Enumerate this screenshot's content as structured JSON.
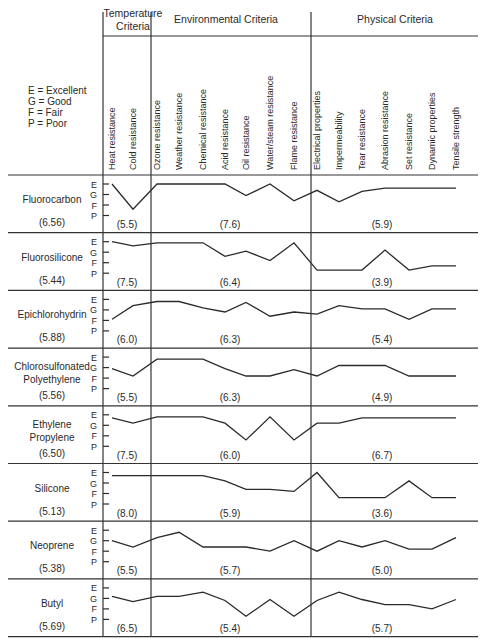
{
  "chart_data": {
    "type": "line",
    "rating_scale": [
      "P",
      "F",
      "G",
      "E"
    ],
    "rating_numeric": {
      "E": 4,
      "G": 3,
      "F": 2,
      "P": 1
    },
    "legend": [
      "E = Excellent",
      "G = Good",
      "F = Fair",
      "P = Poor"
    ],
    "groups": [
      {
        "name": "Temperature Criteria",
        "label_lines": [
          "Temperature",
          "Criteria"
        ],
        "columns": [
          "Heat resistance",
          "Cold resistance"
        ]
      },
      {
        "name": "Environmental Criteria",
        "label_lines": [
          "Environmental Criteria"
        ],
        "columns": [
          "Ozone resistance",
          "Weather resistance",
          "Chemical resistance",
          "Acid resistance",
          "Oil resistance",
          "Water/steam resistance",
          "Flame resistance"
        ]
      },
      {
        "name": "Physical Criteria",
        "label_lines": [
          "Physical Criteria"
        ],
        "columns": [
          "Electrical properties",
          "Impermeability",
          "Tear resistance",
          "Abrasion resistance",
          "Set resistance",
          "Dynamic properties",
          "Tensile strength"
        ]
      }
    ],
    "categories": [
      "Heat resistance",
      "Cold resistance",
      "Ozone resistance",
      "Weather resistance",
      "Chemical resistance",
      "Acid resistance",
      "Oil resistance",
      "Water/steam resistance",
      "Flame resistance",
      "Electrical properties",
      "Impermeability",
      "Tear resistance",
      "Abrasion resistance",
      "Set resistance",
      "Dynamic properties",
      "Tensile strength"
    ],
    "series": [
      {
        "name": "Fluorocarbon",
        "label_lines": [
          "Fluorocarbon"
        ],
        "overall": "(6.56)",
        "group_scores": [
          "(5.5)",
          "(7.6)",
          "(5.9)"
        ],
        "values": [
          4.0,
          1.6,
          4.0,
          4.0,
          4.0,
          4.0,
          2.9,
          4.0,
          2.4,
          3.4,
          2.3,
          3.3,
          3.6,
          3.6,
          3.6,
          3.6
        ]
      },
      {
        "name": "Fluorosilicone",
        "label_lines": [
          "Fluorosilicone"
        ],
        "overall": "(5.44)",
        "group_scores": [
          "(7.5)",
          "(6.4)",
          "(3.9)"
        ],
        "values": [
          4.0,
          3.6,
          3.9,
          3.9,
          3.9,
          2.6,
          3.1,
          2.2,
          3.9,
          1.3,
          1.3,
          1.3,
          3.2,
          1.3,
          1.7,
          1.7
        ]
      },
      {
        "name": "Epichlorohydrin",
        "label_lines": [
          "Epichlorohydrin"
        ],
        "overall": "(5.88)",
        "group_scores": [
          "(6.0)",
          "(6.3)",
          "(5.4)"
        ],
        "values": [
          2.1,
          3.4,
          3.8,
          3.8,
          3.2,
          2.8,
          3.7,
          2.4,
          2.8,
          2.6,
          3.4,
          3.1,
          3.1,
          2.1,
          3.1,
          3.1
        ]
      },
      {
        "name": "Chlorosulfonated Polyethylene",
        "label_lines": [
          "Chlorosulfonated",
          "Polyethylene"
        ],
        "overall": "(5.56)",
        "group_scores": [
          "(5.5)",
          "(6.3)",
          "(4.9)"
        ],
        "values": [
          2.9,
          2.2,
          3.8,
          3.8,
          3.8,
          2.9,
          2.2,
          2.2,
          2.8,
          2.2,
          3.2,
          3.2,
          3.2,
          2.2,
          2.2,
          2.2
        ]
      },
      {
        "name": "Ethylene Propylene",
        "label_lines": [
          "Ethylene",
          "Propylene"
        ],
        "overall": "(6.50)",
        "group_scores": [
          "(7.5)",
          "(6.0)",
          "(6.7)"
        ],
        "values": [
          3.7,
          3.2,
          3.8,
          3.8,
          3.8,
          3.2,
          1.6,
          3.8,
          1.6,
          3.2,
          3.2,
          3.7,
          3.7,
          3.7,
          3.7,
          3.7
        ]
      },
      {
        "name": "Silicone",
        "label_lines": [
          "Silicone"
        ],
        "overall": "(5.13)",
        "group_scores": [
          "(8.0)",
          "(5.9)",
          "(3.6)"
        ],
        "values": [
          3.7,
          3.7,
          3.7,
          3.7,
          3.7,
          3.2,
          2.4,
          2.4,
          2.2,
          4.0,
          1.6,
          1.6,
          1.6,
          3.2,
          1.6,
          1.6
        ]
      },
      {
        "name": "Neoprene",
        "label_lines": [
          "Neoprene"
        ],
        "overall": "(5.38)",
        "group_scores": [
          "(5.5)",
          "(5.7)",
          "(5.0)"
        ],
        "values": [
          3.0,
          2.4,
          3.3,
          3.8,
          2.4,
          2.4,
          2.4,
          2.0,
          3.0,
          2.0,
          3.0,
          2.4,
          3.0,
          2.2,
          2.2,
          3.3
        ]
      },
      {
        "name": "Butyl",
        "label_lines": [
          "Butyl"
        ],
        "overall": "(5.69)",
        "group_scores": [
          "(6.5)",
          "(5.4)",
          "(5.7)"
        ],
        "values": [
          3.2,
          2.7,
          3.2,
          3.2,
          3.6,
          2.8,
          1.3,
          2.9,
          1.3,
          2.8,
          3.6,
          2.9,
          2.4,
          2.4,
          2.0,
          2.9
        ]
      }
    ],
    "ylim": [
      1,
      4
    ],
    "grid": false,
    "legend_position": "top-left"
  },
  "layout": {
    "header_top": 36,
    "header_bottom": 175,
    "row_top": 175,
    "row_height": 57.7,
    "chart_left": 103,
    "chart_right": 478,
    "dividers_x": [
      103,
      151,
      311
    ],
    "column_x": [
      112,
      133,
      157,
      179,
      203,
      225,
      246,
      270,
      294,
      317,
      339,
      362,
      385,
      409,
      432,
      456
    ],
    "group_label_x": [
      133,
      226,
      395
    ],
    "group_score_x": [
      127,
      230,
      382
    ]
  }
}
